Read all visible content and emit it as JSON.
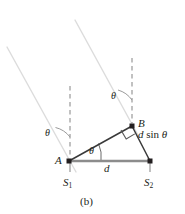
{
  "figure": {
    "caption": "(b)",
    "colors": {
      "line_dark": "#231f20",
      "line_gray": "#808080",
      "ray_light": "#dcdcdc",
      "dash_gray": "#a8a8a8",
      "baseline_gray": "#8c8c8c",
      "background": "#ffffff"
    },
    "points": [
      {
        "id": "A",
        "label": "A",
        "x": 69,
        "y": 161
      },
      {
        "id": "B",
        "label": "B",
        "x": 132,
        "y": 126
      }
    ],
    "sources": [
      {
        "id": "S1",
        "label": "S",
        "sub": "1",
        "x": 69,
        "y": 161
      },
      {
        "id": "S2",
        "label": "S",
        "sub": "2",
        "x": 150,
        "y": 161
      }
    ],
    "angles": [
      {
        "id": "theta-upper-left",
        "label": "θ",
        "x": 50,
        "y": 133
      },
      {
        "id": "theta-upper-right",
        "label": "θ",
        "x": 116,
        "y": 96
      },
      {
        "id": "theta-vertex-a",
        "label": "θ",
        "x": 92,
        "y": 151
      }
    ],
    "dimensions": [
      {
        "id": "path-difference",
        "text_parts": [
          "d",
          " sin ",
          "θ"
        ],
        "text": "d sin θ",
        "x": 141,
        "y": 133
      },
      {
        "id": "slit-separation",
        "text": "d",
        "x": 106,
        "y": 167
      }
    ],
    "right_angle_marker": {
      "id": "right-angle-at-b",
      "present": true
    },
    "rays": [
      {
        "id": "ray-from-a",
        "x1": 7,
        "y1": 47,
        "x2": 76,
        "y2": 172
      },
      {
        "id": "ray-from-b",
        "x1": 75,
        "y1": 20,
        "x2": 139,
        "y2": 137
      }
    ],
    "dashed_verticals": [
      {
        "id": "dashed-vertical-a",
        "x": 70,
        "y1": 85,
        "y2": 158
      },
      {
        "id": "dashed-vertical-b",
        "x": 132,
        "y1": 58,
        "y2": 124
      }
    ]
  }
}
